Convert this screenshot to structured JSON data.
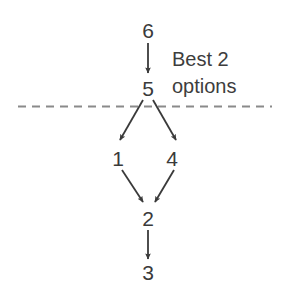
{
  "figure": {
    "type": "flow-diagram",
    "width": 286,
    "height": 304,
    "background_color": "#ffffff",
    "node_text_color": "#3a3a3a",
    "arrow_color": "#3a3a3a",
    "divider_color": "#8a8a8a"
  },
  "nodes": [
    {
      "id": "n6",
      "label": "6",
      "x": 148,
      "y": 30
    },
    {
      "id": "n5",
      "label": "5",
      "x": 148,
      "y": 88
    },
    {
      "id": "n1",
      "label": "1",
      "x": 118,
      "y": 158
    },
    {
      "id": "n4",
      "label": "4",
      "x": 172,
      "y": 158
    },
    {
      "id": "n2",
      "label": "2",
      "x": 148,
      "y": 218
    },
    {
      "id": "n3",
      "label": "3",
      "x": 148,
      "y": 272
    }
  ],
  "edges": [
    {
      "from": "6",
      "to": "5"
    },
    {
      "from": "5",
      "to": "1"
    },
    {
      "from": "5",
      "to": "4"
    },
    {
      "from": "1",
      "to": "2"
    },
    {
      "from": "4",
      "to": "2"
    },
    {
      "from": "2",
      "to": "3"
    }
  ],
  "divider": {
    "style": "dashed",
    "orientation": "horizontal",
    "y": 106,
    "x_start": 18,
    "x_end": 272
  },
  "annotation": {
    "line1": "Best 2",
    "line2": "options",
    "x": 172,
    "y": 46
  }
}
